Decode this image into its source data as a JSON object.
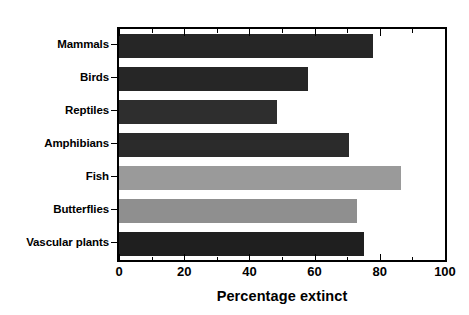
{
  "chart_data": {
    "type": "bar",
    "orientation": "horizontal",
    "title": "",
    "xlabel": "Percentage extinct",
    "ylabel": "",
    "xlim": [
      0,
      100
    ],
    "xticks": [
      0,
      20,
      40,
      60,
      80,
      100
    ],
    "xtick_labels": [
      "0",
      "20",
      "40",
      "60",
      "80",
      "100"
    ],
    "minor_tick_interval": 10,
    "grid": false,
    "legend": false,
    "categories": [
      "Mammals",
      "Birds",
      "Reptiles",
      "Amphibians",
      "Fish",
      "Butterflies",
      "Vascular plants"
    ],
    "values": [
      78,
      58,
      48.5,
      70.5,
      86.5,
      73,
      75
    ],
    "bar_colors": [
      "#262626",
      "#262626",
      "#2e2e2e",
      "#2b2b2b",
      "#9a9a9a",
      "#8f8f8f",
      "#1f1f1f"
    ]
  },
  "axis": {
    "x_title": "Percentage extinct",
    "tick_labels": [
      "0",
      "20",
      "40",
      "60",
      "80",
      "100"
    ]
  },
  "colors": {
    "frame": "#000000",
    "background": "#ffffff",
    "dark_bar": "#262626",
    "light_bar": "#9a9a9a"
  }
}
